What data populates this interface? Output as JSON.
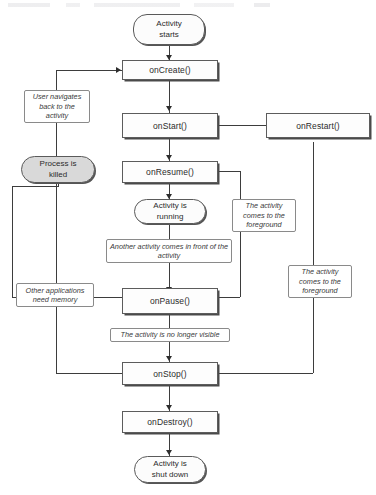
{
  "diagram": {
    "type": "flowchart",
    "nodes": {
      "activity_starts": "Activity\nstarts",
      "on_create": "onCreate()",
      "on_start": "onStart()",
      "on_resume": "onResume()",
      "activity_running": "Activity is\nrunning",
      "on_pause": "onPause()",
      "on_stop": "onStop()",
      "on_destroy": "onDestroy()",
      "activity_shut_down": "Activity is\nshut down",
      "on_restart": "onRestart()",
      "process_killed": "Process is\nkilled"
    },
    "edge_labels": {
      "user_navigates_back": "User navigates back to the activity",
      "another_activity_front": "Another activity comes in front of the activity",
      "other_apps_need_memory": "Other applications need memory",
      "no_longer_visible": "The activity is no longer visible",
      "comes_to_foreground_upper": "The activity comes to the foreground",
      "comes_to_foreground_lower": "The activity comes to the foreground"
    },
    "colors": {
      "line": "#3d3d3d",
      "box_border": "#5c5c5c",
      "box_fill": "#fdfdfd",
      "terminal_fill": "#fcfcfc",
      "killed_fill": "#d9d9d9",
      "text": "#2b2b2b"
    }
  }
}
